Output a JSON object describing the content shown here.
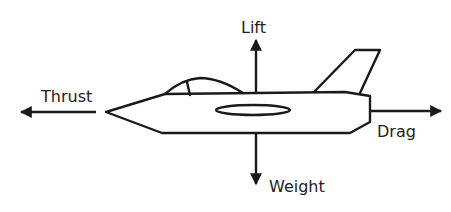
{
  "diagram": {
    "type": "forces-on-aircraft",
    "forces": {
      "lift": {
        "label": "Lift",
        "direction": "up"
      },
      "weight": {
        "label": "Weight",
        "direction": "down"
      },
      "thrust": {
        "label": "Thrust",
        "direction": "left"
      },
      "drag": {
        "label": "Drag",
        "direction": "right"
      }
    },
    "colors": {
      "stroke": "#1a1a1a",
      "background": "#ffffff",
      "text": "#222222"
    }
  }
}
